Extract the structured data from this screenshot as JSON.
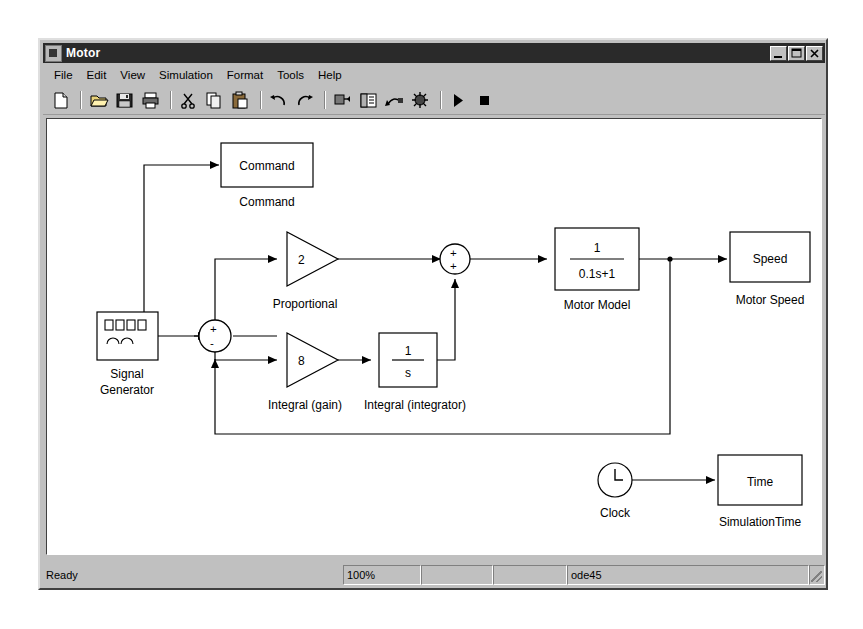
{
  "window": {
    "title": "Motor",
    "icon": "simulink-model-icon",
    "controls": [
      {
        "name": "minimize-button",
        "glyph": "minimize"
      },
      {
        "name": "maximize-button",
        "glyph": "maximize"
      },
      {
        "name": "close-button",
        "glyph": "close"
      }
    ]
  },
  "menubar": {
    "items": [
      {
        "label": "File"
      },
      {
        "label": "Edit"
      },
      {
        "label": "View"
      },
      {
        "label": "Simulation"
      },
      {
        "label": "Format"
      },
      {
        "label": "Tools"
      },
      {
        "label": "Help"
      }
    ]
  },
  "toolbar": {
    "buttons": [
      {
        "name": "new-model-button",
        "icon": "new-document-icon"
      },
      {
        "name": "open-model-button",
        "icon": "open-folder-icon"
      },
      {
        "name": "save-model-button",
        "icon": "floppy-disk-icon"
      },
      {
        "name": "print-button",
        "icon": "printer-icon"
      },
      {
        "name": "cut-button",
        "icon": "scissors-icon"
      },
      {
        "name": "copy-button",
        "icon": "copy-icon"
      },
      {
        "name": "paste-button",
        "icon": "clipboard-icon"
      },
      {
        "name": "undo-button",
        "icon": "undo-arrow-icon"
      },
      {
        "name": "redo-button",
        "icon": "redo-arrow-icon"
      },
      {
        "name": "library-browser-button",
        "icon": "library-icon"
      },
      {
        "name": "model-explorer-button",
        "icon": "explorer-icon"
      },
      {
        "name": "update-diagram-button",
        "icon": "update-diagram-icon"
      },
      {
        "name": "debug-button",
        "icon": "debug-icon"
      },
      {
        "name": "start-simulation-button",
        "icon": "play-triangle-icon"
      },
      {
        "name": "stop-simulation-button",
        "icon": "stop-square-icon"
      }
    ]
  },
  "statusbar": {
    "ready": "Ready",
    "zoom": "100%",
    "pane_a": "",
    "pane_b": "",
    "solver": "ode45"
  },
  "diagram": {
    "blocks": {
      "signal_generator": {
        "label": "Signal\nGenerator",
        "label_line1": "Signal",
        "label_line2": "Generator"
      },
      "sum1": {
        "signs": [
          "+",
          "-"
        ]
      },
      "proportional": {
        "value": "2",
        "label": "Proportional"
      },
      "integral_gain": {
        "value": "8",
        "label": "Integral (gain)"
      },
      "integrator": {
        "numerator": "1",
        "denominator": "s",
        "label": "Integral (integrator)"
      },
      "sum2": {
        "signs": [
          "+",
          "+"
        ]
      },
      "motor_model": {
        "numerator": "1",
        "denominator": "0.1s+1",
        "label": "Motor Model"
      },
      "motor_speed": {
        "text": "Speed",
        "label": "Motor Speed"
      },
      "command": {
        "text": "Command",
        "label": "Command"
      },
      "clock": {
        "label": "Clock",
        "glyph": "clock-face"
      },
      "simulation_time": {
        "text": "Time",
        "label": "SimulationTime"
      }
    }
  }
}
